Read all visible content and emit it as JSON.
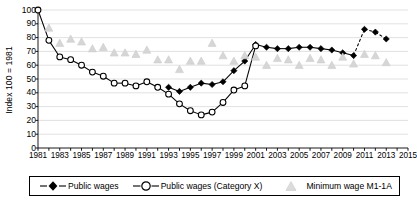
{
  "chart_data": {
    "type": "line",
    "title": "",
    "subtitle": "",
    "xlabel": "",
    "ylabel": "Index 100 = 1981",
    "xlim": [
      1981,
      2015
    ],
    "ylim": [
      0,
      100
    ],
    "yticks": [
      0,
      10,
      20,
      30,
      40,
      50,
      60,
      70,
      80,
      90,
      100
    ],
    "xticks": [
      1981,
      1983,
      1985,
      1987,
      1989,
      1991,
      1993,
      1995,
      1997,
      1999,
      2001,
      2003,
      2005,
      2007,
      2009,
      2011,
      2013,
      2015
    ],
    "x_tick_step": 2,
    "x_minor_tick_step": 1,
    "grid": "horizontal",
    "legend_position": "bottom",
    "x": [
      1981,
      1982,
      1983,
      1984,
      1985,
      1986,
      1987,
      1988,
      1989,
      1990,
      1991,
      1992,
      1993,
      1994,
      1995,
      1996,
      1997,
      1998,
      1999,
      2000,
      2001,
      2002,
      2003,
      2004,
      2005,
      2006,
      2007,
      2008,
      2009,
      2010,
      2011,
      2012,
      2013
    ],
    "series": [
      {
        "name": "Public wages",
        "marker": "filled-diamond",
        "color": "#000000",
        "line": "solid",
        "x": [
          1993,
          1994,
          1995,
          1996,
          1997,
          1998,
          1999,
          2000,
          2001,
          2002,
          2003,
          2004,
          2005,
          2006,
          2007,
          2008,
          2009,
          2010,
          2011,
          2012,
          2013
        ],
        "values": [
          44,
          41,
          44,
          47,
          46,
          48,
          56,
          63,
          75,
          73,
          72,
          72,
          73,
          73,
          72,
          71,
          69,
          67,
          86,
          84,
          79
        ],
        "dashed_segments": [
          [
            2010,
            2011
          ],
          [
            2011,
            2012
          ],
          [
            2012,
            2013
          ]
        ]
      },
      {
        "name": "Public wages (Category X)",
        "marker": "open-circle",
        "color": "#000000",
        "line": "solid",
        "x": [
          1981,
          1982,
          1983,
          1984,
          1985,
          1986,
          1987,
          1988,
          1989,
          1990,
          1991,
          1992,
          1993,
          1994,
          1995,
          1996,
          1997,
          1998,
          1999,
          2000,
          2001
        ],
        "values": [
          100,
          78,
          66,
          64,
          60,
          55,
          52,
          47,
          47,
          45,
          48,
          44,
          39,
          32,
          27,
          24,
          26,
          33,
          42,
          45,
          74
        ]
      },
      {
        "name": "Minimum wage M1-1A",
        "marker": "light-triangle",
        "color": "#d6d6d6",
        "line": "none",
        "x": [
          1982,
          1983,
          1984,
          1985,
          1986,
          1987,
          1988,
          1989,
          1990,
          1991,
          1992,
          1993,
          1994,
          1995,
          1996,
          1997,
          1998,
          1999,
          2000,
          2001,
          2002,
          2003,
          2004,
          2005,
          2006,
          2007,
          2008,
          2009,
          2010,
          2011,
          2012,
          2013
        ],
        "values": [
          87,
          76,
          79,
          77,
          72,
          73,
          69,
          69,
          68,
          71,
          64,
          64,
          57,
          63,
          63,
          76,
          67,
          63,
          67,
          66,
          60,
          65,
          64,
          60,
          65,
          64,
          60,
          66,
          61,
          68,
          67,
          62
        ]
      }
    ]
  },
  "legend": {
    "entries": [
      {
        "label": "Public wages",
        "marker": "filled-diamond"
      },
      {
        "label": "Public wages (Category X)",
        "marker": "open-circle"
      },
      {
        "label": "Minimum wage M1-1A",
        "marker": "light-triangle"
      }
    ]
  },
  "colors": {
    "axis": "#000000",
    "grid": "#d9d9d9",
    "series_dark": "#000000",
    "series_light": "#d6d6d6"
  }
}
